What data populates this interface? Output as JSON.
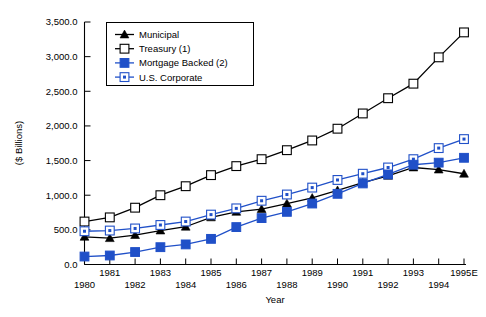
{
  "chart_data": {
    "type": "line",
    "title": "",
    "xlabel": "Year",
    "ylabel": "($ Billions)",
    "ylim": [
      0,
      3500
    ],
    "ytick_step": 500,
    "ytick_labels": [
      "0.0",
      "500.0",
      "1,000.0",
      "1,500.0",
      "2,000.0",
      "2,500.0",
      "3,000.0",
      "3,500.0"
    ],
    "ytick_values": [
      0,
      500,
      1000,
      1500,
      2000,
      2500,
      3000,
      3500
    ],
    "grid": false,
    "legend_position": "top-left-inside",
    "categories": [
      "1980",
      "1981",
      "1982",
      "1983",
      "1984",
      "1985",
      "1986",
      "1987",
      "1988",
      "1989",
      "1990",
      "1991",
      "1992",
      "1993",
      "1994",
      "1995E"
    ],
    "xtick_labels": [
      "1980",
      "1981",
      "1982",
      "1983",
      "1984",
      "1985",
      "1986",
      "1987",
      "1988",
      "1989",
      "1990",
      "1991",
      "1992",
      "1993",
      "1994",
      "1995E"
    ],
    "series": [
      {
        "name": "Municipal",
        "color": "#000000",
        "marker": "triangle-filled",
        "values": [
          400,
          380,
          425,
          490,
          545,
          680,
          760,
          800,
          880,
          960,
          1070,
          1180,
          1280,
          1400,
          1370,
          1310
        ]
      },
      {
        "name": "Treasury (1)",
        "color": "#000000",
        "marker": "square-open",
        "values": [
          620,
          680,
          820,
          1000,
          1130,
          1290,
          1420,
          1520,
          1650,
          1790,
          1960,
          2180,
          2400,
          2610,
          2990,
          3350
        ]
      },
      {
        "name": "Mortgage Backed (2)",
        "color": "#2050c8",
        "marker": "square-filled",
        "values": [
          115,
          130,
          180,
          250,
          290,
          370,
          540,
          670,
          760,
          880,
          1020,
          1170,
          1300,
          1440,
          1470,
          1540
        ]
      },
      {
        "name": "U.S. Corporate",
        "color": "#2050c8",
        "marker": "square-dot",
        "values": [
          480,
          490,
          520,
          570,
          620,
          720,
          810,
          920,
          1010,
          1110,
          1220,
          1310,
          1400,
          1520,
          1680,
          1810
        ]
      }
    ]
  },
  "legend": {
    "entries": [
      {
        "label": "Municipal"
      },
      {
        "label": "Treasury (1)"
      },
      {
        "label": "Mortgage Backed (2)"
      },
      {
        "label": "U.S. Corporate"
      }
    ]
  },
  "colors": {
    "series_black": "#000000",
    "series_blue": "#2050c8",
    "background": "#ffffff"
  }
}
